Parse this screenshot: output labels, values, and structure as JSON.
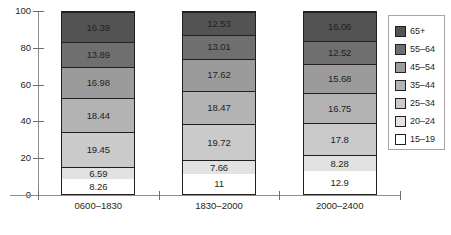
{
  "chart_data": {
    "type": "bar",
    "stacked": true,
    "title": "",
    "subtitle": "",
    "xlabel": "",
    "ylabel": "",
    "ylim": [
      0,
      100
    ],
    "yticks": [
      0,
      20,
      40,
      60,
      80,
      100
    ],
    "grid": false,
    "legend_position": "right",
    "categories": [
      "0600–1830",
      "1830–2000",
      "2000–2400"
    ],
    "series": [
      {
        "name": "15–19",
        "color": "#ffffff",
        "values": [
          8.26,
          11,
          12.9
        ],
        "labels": [
          "8.26",
          "11",
          "12.9"
        ]
      },
      {
        "name": "20–24",
        "color": "#e2e2e2",
        "values": [
          6.59,
          7.66,
          8.28
        ],
        "labels": [
          "6.59",
          "7.66",
          "8.28"
        ]
      },
      {
        "name": "25–34",
        "color": "#cacaca",
        "values": [
          19.45,
          19.72,
          17.8
        ],
        "labels": [
          "19.45",
          "19.72",
          "17.8"
        ]
      },
      {
        "name": "35–44",
        "color": "#b3b3b3",
        "values": [
          18.44,
          18.47,
          16.75
        ],
        "labels": [
          "18.44",
          "18.47",
          "16.75"
        ]
      },
      {
        "name": "45–54",
        "color": "#9b9b9b",
        "values": [
          16.98,
          17.62,
          15.68
        ],
        "labels": [
          "16.98",
          "17.62",
          "15.68"
        ]
      },
      {
        "name": "55–64",
        "color": "#6f6f6f",
        "values": [
          13.89,
          13.01,
          12.52
        ],
        "labels": [
          "13.89",
          "13.01",
          "12.52"
        ]
      },
      {
        "name": "65+",
        "color": "#535353",
        "values": [
          16.39,
          12.53,
          16.06
        ],
        "labels": [
          "16.39",
          "12.53",
          "16.06"
        ]
      }
    ],
    "column_totals": [
      100.0,
      100.01,
      99.99
    ]
  },
  "axis": {
    "y_tick_labels": [
      "100",
      "80",
      "60",
      "40",
      "20",
      "0"
    ]
  },
  "legend": {
    "items": [
      {
        "label": "65+"
      },
      {
        "label": "55–64"
      },
      {
        "label": "45–54"
      },
      {
        "label": "35–44"
      },
      {
        "label": "25–34"
      },
      {
        "label": "20–24"
      },
      {
        "label": "15–19"
      }
    ]
  }
}
